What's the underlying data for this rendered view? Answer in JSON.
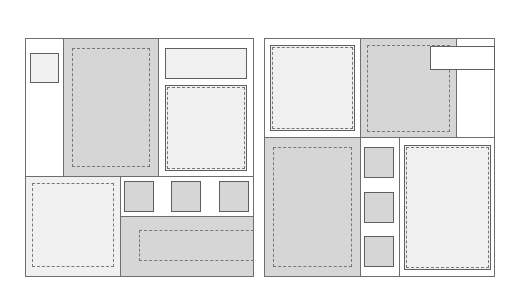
{
  "colors": {
    "border": "#6e6e6e",
    "dashed": "#777777",
    "white": "#ffffff",
    "light": "#f0f0f0",
    "gray": "#d6d6d6"
  },
  "panels": [
    {
      "name": "left-layout",
      "regions": [
        {
          "name": "left-narrow-column",
          "fill": "white"
        },
        {
          "name": "left-small-box",
          "fill": "light",
          "border": "solid"
        },
        {
          "name": "center-gray-column",
          "fill": "gray"
        },
        {
          "name": "center-dashed-box",
          "border": "dashed"
        },
        {
          "name": "right-top-bar",
          "fill": "light",
          "border": "solid"
        },
        {
          "name": "right-dashed-box",
          "fill": "light",
          "border": "solid+dashed"
        },
        {
          "name": "bottom-left-dashed-area",
          "fill": "light",
          "border": "dashed"
        },
        {
          "name": "thumbnail-row",
          "fill": "white",
          "items": 3
        },
        {
          "name": "bottom-right-gray-area",
          "fill": "gray"
        },
        {
          "name": "bottom-right-dashed-bar",
          "border": "dashed"
        }
      ]
    },
    {
      "name": "right-layout",
      "regions": [
        {
          "name": "top-left-dashed-box",
          "fill": "light",
          "border": "solid+dashed"
        },
        {
          "name": "top-center-gray-area",
          "fill": "gray"
        },
        {
          "name": "top-center-dashed-box",
          "border": "dashed"
        },
        {
          "name": "top-right-white-box",
          "fill": "white",
          "border": "solid"
        },
        {
          "name": "top-right-column",
          "fill": "white"
        },
        {
          "name": "bottom-left-gray-area",
          "fill": "gray"
        },
        {
          "name": "bottom-left-dashed-box",
          "border": "dashed"
        },
        {
          "name": "thumbnail-column",
          "fill": "white",
          "items": 3
        },
        {
          "name": "bottom-right-dashed-box",
          "fill": "light",
          "border": "solid+dashed"
        }
      ]
    }
  ]
}
